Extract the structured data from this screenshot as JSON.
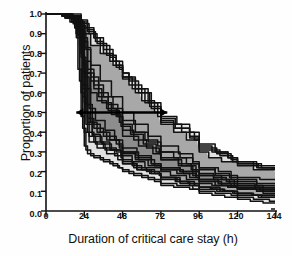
{
  "chart_data": {
    "type": "line",
    "title": "",
    "subtitle": "",
    "xlabel": "Duration of critical care stay (h)",
    "ylabel": "Proportion of patients",
    "xlim": [
      0,
      144
    ],
    "ylim": [
      0.0,
      1.0
    ],
    "grid": false,
    "legend_position": "none",
    "xticks": [
      0,
      24,
      48,
      72,
      96,
      120,
      144
    ],
    "xtick_labels": [
      "0",
      "24",
      "48",
      "72",
      "96",
      "120",
      "144"
    ],
    "yticks": [
      0.0,
      0.1,
      0.2,
      0.3,
      0.4,
      0.5,
      0.6,
      0.7,
      0.8,
      0.9,
      1.0
    ],
    "ytick_labels": [
      "0.0",
      "0.1",
      "0.2",
      "0.3",
      "0.4",
      "0.5",
      "0.6",
      "0.7",
      "0.8",
      "0.9",
      "1.0"
    ],
    "annotations": [
      {
        "name": "median-stay-arrow",
        "type": "double-headed-arrow",
        "y": 0.5,
        "x_start": 19,
        "x_end": 76,
        "label": ""
      }
    ],
    "bands": [
      {
        "name": "light-gray-envelope",
        "color": "#e2e2e2",
        "opacity": 1.0
      },
      {
        "name": "mid-gray-envelope",
        "color": "#a8a8a8",
        "opacity": 1.0
      },
      {
        "name": "dark-gray-envelope",
        "color": "#8d8d8d",
        "opacity": 1.0
      }
    ],
    "series_color": "#111111",
    "series_count": 22,
    "series": [
      {
        "name": "unit-01",
        "x": [
          0,
          8,
          14,
          18,
          20,
          22,
          24,
          26,
          30,
          36,
          42,
          46,
          48,
          52,
          60,
          68,
          72,
          80,
          90,
          96,
          104,
          112,
          120,
          128,
          136,
          144
        ],
        "values": [
          1.0,
          1.0,
          0.98,
          0.93,
          0.72,
          0.48,
          0.33,
          0.29,
          0.27,
          0.25,
          0.23,
          0.22,
          0.21,
          0.19,
          0.17,
          0.15,
          0.13,
          0.12,
          0.11,
          0.09,
          0.08,
          0.07,
          0.06,
          0.05,
          0.04,
          0.03
        ]
      },
      {
        "name": "unit-02",
        "x": [
          0,
          10,
          16,
          19,
          21,
          23,
          25,
          28,
          34,
          40,
          45,
          48,
          55,
          64,
          72,
          82,
          92,
          96,
          106,
          116,
          120,
          130,
          140,
          144
        ],
        "values": [
          1.0,
          0.99,
          0.96,
          0.9,
          0.66,
          0.42,
          0.31,
          0.28,
          0.26,
          0.24,
          0.22,
          0.2,
          0.18,
          0.16,
          0.14,
          0.13,
          0.11,
          0.1,
          0.09,
          0.08,
          0.07,
          0.06,
          0.05,
          0.04
        ]
      },
      {
        "name": "unit-03",
        "x": [
          0,
          12,
          18,
          22,
          24,
          26,
          30,
          36,
          44,
          48,
          54,
          62,
          72,
          78,
          88,
          96,
          104,
          114,
          120,
          132,
          144
        ],
        "values": [
          1.0,
          0.99,
          0.95,
          0.8,
          0.55,
          0.4,
          0.35,
          0.32,
          0.3,
          0.28,
          0.25,
          0.22,
          0.2,
          0.18,
          0.16,
          0.14,
          0.13,
          0.12,
          0.11,
          0.1,
          0.09
        ]
      },
      {
        "name": "unit-04",
        "x": [
          0,
          14,
          20,
          24,
          26,
          28,
          32,
          38,
          46,
          48,
          56,
          66,
          72,
          84,
          94,
          96,
          108,
          118,
          120,
          134,
          144
        ],
        "values": [
          1.0,
          0.98,
          0.94,
          0.86,
          0.62,
          0.45,
          0.4,
          0.36,
          0.33,
          0.3,
          0.27,
          0.24,
          0.22,
          0.2,
          0.18,
          0.16,
          0.14,
          0.13,
          0.12,
          0.11,
          0.1
        ]
      },
      {
        "name": "unit-05",
        "x": [
          0,
          16,
          22,
          26,
          30,
          34,
          40,
          44,
          48,
          52,
          58,
          66,
          72,
          80,
          88,
          96,
          102,
          110,
          120,
          130,
          144
        ],
        "values": [
          1.0,
          1.0,
          0.97,
          0.92,
          0.88,
          0.84,
          0.78,
          0.74,
          0.7,
          0.66,
          0.6,
          0.52,
          0.45,
          0.4,
          0.36,
          0.3,
          0.27,
          0.25,
          0.23,
          0.21,
          0.2
        ]
      },
      {
        "name": "unit-06",
        "x": [
          0,
          10,
          18,
          24,
          28,
          34,
          40,
          46,
          48,
          56,
          64,
          72,
          82,
          90,
          96,
          106,
          114,
          120,
          132,
          144
        ],
        "values": [
          1.0,
          0.99,
          0.96,
          0.9,
          0.84,
          0.8,
          0.76,
          0.72,
          0.68,
          0.62,
          0.55,
          0.48,
          0.44,
          0.4,
          0.34,
          0.3,
          0.27,
          0.25,
          0.22,
          0.2
        ]
      },
      {
        "name": "unit-07",
        "x": [
          0,
          12,
          20,
          24,
          28,
          32,
          38,
          44,
          48,
          54,
          62,
          70,
          72,
          84,
          92,
          96,
          108,
          116,
          120,
          134,
          144
        ],
        "values": [
          1.0,
          0.98,
          0.92,
          0.7,
          0.6,
          0.56,
          0.52,
          0.48,
          0.44,
          0.4,
          0.36,
          0.33,
          0.3,
          0.27,
          0.24,
          0.22,
          0.2,
          0.18,
          0.17,
          0.16,
          0.15
        ]
      },
      {
        "name": "unit-08",
        "x": [
          0,
          8,
          16,
          22,
          26,
          30,
          36,
          42,
          48,
          56,
          64,
          72,
          80,
          88,
          96,
          106,
          116,
          120,
          132,
          144
        ],
        "values": [
          1.0,
          1.0,
          0.97,
          0.86,
          0.72,
          0.64,
          0.58,
          0.52,
          0.46,
          0.4,
          0.35,
          0.3,
          0.27,
          0.24,
          0.21,
          0.18,
          0.16,
          0.15,
          0.13,
          0.12
        ]
      },
      {
        "name": "unit-09",
        "x": [
          0,
          14,
          20,
          23,
          25,
          27,
          31,
          37,
          43,
          48,
          54,
          60,
          68,
          72,
          82,
          90,
          96,
          104,
          112,
          120,
          130,
          144
        ],
        "values": [
          1.0,
          0.99,
          0.93,
          0.75,
          0.5,
          0.38,
          0.34,
          0.31,
          0.28,
          0.26,
          0.23,
          0.21,
          0.19,
          0.17,
          0.15,
          0.13,
          0.12,
          0.11,
          0.1,
          0.09,
          0.08,
          0.07
        ]
      },
      {
        "name": "unit-10",
        "x": [
          0,
          10,
          17,
          21,
          23,
          25,
          29,
          35,
          41,
          47,
          48,
          55,
          63,
          71,
          72,
          84,
          93,
          96,
          107,
          117,
          120,
          133,
          144
        ],
        "values": [
          1.0,
          0.99,
          0.95,
          0.84,
          0.58,
          0.44,
          0.38,
          0.34,
          0.31,
          0.28,
          0.25,
          0.22,
          0.2,
          0.18,
          0.16,
          0.14,
          0.13,
          0.11,
          0.1,
          0.09,
          0.08,
          0.07,
          0.06
        ]
      },
      {
        "name": "unit-11",
        "x": [
          0,
          6,
          14,
          20,
          24,
          30,
          36,
          42,
          48,
          52,
          60,
          68,
          72,
          80,
          90,
          96,
          104,
          114,
          120,
          130,
          144
        ],
        "values": [
          1.0,
          1.0,
          0.99,
          0.96,
          0.93,
          0.88,
          0.82,
          0.76,
          0.7,
          0.64,
          0.56,
          0.5,
          0.46,
          0.42,
          0.38,
          0.33,
          0.3,
          0.27,
          0.25,
          0.23,
          0.21
        ]
      },
      {
        "name": "unit-12",
        "x": [
          0,
          12,
          19,
          23,
          26,
          30,
          36,
          44,
          48,
          58,
          68,
          72,
          86,
          94,
          96,
          110,
          118,
          120,
          136,
          144
        ],
        "values": [
          1.0,
          0.98,
          0.9,
          0.64,
          0.47,
          0.42,
          0.38,
          0.34,
          0.3,
          0.26,
          0.23,
          0.21,
          0.19,
          0.17,
          0.15,
          0.13,
          0.12,
          0.11,
          0.09,
          0.08
        ]
      },
      {
        "name": "unit-13",
        "x": [
          0,
          16,
          22,
          25,
          28,
          33,
          39,
          45,
          48,
          53,
          61,
          69,
          72,
          83,
          91,
          96,
          105,
          113,
          120,
          131,
          144
        ],
        "values": [
          1.0,
          0.99,
          0.94,
          0.82,
          0.68,
          0.6,
          0.54,
          0.48,
          0.43,
          0.39,
          0.34,
          0.3,
          0.27,
          0.24,
          0.21,
          0.19,
          0.17,
          0.15,
          0.14,
          0.12,
          0.11
        ]
      },
      {
        "name": "unit-14",
        "x": [
          0,
          9,
          15,
          19,
          22,
          24,
          27,
          32,
          38,
          45,
          48,
          57,
          65,
          72,
          81,
          89,
          96,
          103,
          111,
          120,
          129,
          144
        ],
        "values": [
          1.0,
          1.0,
          0.96,
          0.88,
          0.6,
          0.4,
          0.35,
          0.32,
          0.29,
          0.26,
          0.24,
          0.21,
          0.19,
          0.17,
          0.15,
          0.14,
          0.12,
          0.11,
          0.1,
          0.09,
          0.08,
          0.06
        ]
      },
      {
        "name": "unit-15",
        "x": [
          0,
          11,
          18,
          22,
          25,
          29,
          34,
          40,
          46,
          48,
          56,
          64,
          72,
          82,
          90,
          96,
          106,
          114,
          120,
          132,
          144
        ],
        "values": [
          1.0,
          0.99,
          0.93,
          0.78,
          0.54,
          0.44,
          0.4,
          0.36,
          0.32,
          0.29,
          0.26,
          0.23,
          0.21,
          0.19,
          0.17,
          0.15,
          0.13,
          0.12,
          0.11,
          0.1,
          0.09
        ]
      },
      {
        "name": "unit-16",
        "x": [
          0,
          13,
          21,
          26,
          31,
          36,
          42,
          48,
          54,
          62,
          70,
          72,
          85,
          93,
          96,
          109,
          117,
          120,
          135,
          144
        ],
        "values": [
          1.0,
          0.99,
          0.96,
          0.91,
          0.86,
          0.8,
          0.74,
          0.68,
          0.62,
          0.55,
          0.48,
          0.44,
          0.4,
          0.36,
          0.31,
          0.28,
          0.25,
          0.24,
          0.22,
          0.2
        ]
      },
      {
        "name": "unit-17",
        "x": [
          0,
          7,
          15,
          21,
          24,
          28,
          33,
          39,
          46,
          48,
          55,
          63,
          71,
          72,
          83,
          92,
          96,
          105,
          115,
          120,
          131,
          144
        ],
        "values": [
          1.0,
          1.0,
          0.98,
          0.92,
          0.76,
          0.66,
          0.58,
          0.51,
          0.45,
          0.41,
          0.36,
          0.32,
          0.29,
          0.26,
          0.23,
          0.2,
          0.18,
          0.16,
          0.14,
          0.13,
          0.11,
          0.1
        ]
      },
      {
        "name": "unit-18",
        "x": [
          0,
          12,
          20,
          24,
          27,
          31,
          37,
          43,
          48,
          57,
          66,
          72,
          84,
          92,
          96,
          108,
          116,
          120,
          134,
          144
        ],
        "values": [
          1.0,
          0.98,
          0.91,
          0.68,
          0.52,
          0.46,
          0.41,
          0.36,
          0.32,
          0.28,
          0.24,
          0.22,
          0.2,
          0.18,
          0.16,
          0.14,
          0.12,
          0.11,
          0.1,
          0.09
        ]
      },
      {
        "name": "unit-19",
        "x": [
          0,
          15,
          22,
          27,
          32,
          38,
          44,
          48,
          56,
          65,
          72,
          81,
          90,
          96,
          107,
          116,
          120,
          133,
          144
        ],
        "values": [
          1.0,
          0.99,
          0.95,
          0.9,
          0.85,
          0.79,
          0.73,
          0.67,
          0.6,
          0.53,
          0.47,
          0.42,
          0.37,
          0.32,
          0.29,
          0.26,
          0.24,
          0.22,
          0.19
        ]
      },
      {
        "name": "unit-20",
        "x": [
          0,
          9,
          17,
          23,
          26,
          30,
          35,
          41,
          47,
          48,
          58,
          67,
          72,
          85,
          94,
          96,
          110,
          118,
          120,
          136,
          144
        ],
        "values": [
          1.0,
          1.0,
          0.97,
          0.88,
          0.7,
          0.62,
          0.55,
          0.49,
          0.43,
          0.38,
          0.33,
          0.29,
          0.26,
          0.23,
          0.2,
          0.18,
          0.16,
          0.14,
          0.13,
          0.11,
          0.1
        ]
      },
      {
        "name": "unit-21",
        "x": [
          0,
          11,
          19,
          24,
          28,
          34,
          41,
          48,
          55,
          64,
          72,
          83,
          92,
          96,
          106,
          115,
          120,
          132,
          144
        ],
        "values": [
          1.0,
          0.99,
          0.94,
          0.83,
          0.74,
          0.66,
          0.58,
          0.5,
          0.44,
          0.38,
          0.33,
          0.29,
          0.25,
          0.22,
          0.19,
          0.17,
          0.16,
          0.14,
          0.12
        ]
      },
      {
        "name": "unit-22",
        "x": [
          0,
          13,
          20,
          23,
          26,
          29,
          34,
          40,
          47,
          48,
          57,
          66,
          72,
          84,
          93,
          96,
          109,
          118,
          120,
          135,
          144
        ],
        "values": [
          1.0,
          0.98,
          0.89,
          0.62,
          0.45,
          0.39,
          0.35,
          0.31,
          0.27,
          0.24,
          0.21,
          0.19,
          0.17,
          0.15,
          0.13,
          0.12,
          0.1,
          0.09,
          0.08,
          0.07,
          0.05
        ]
      }
    ]
  }
}
